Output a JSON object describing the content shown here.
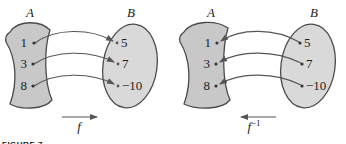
{
  "colors": {
    "set_a_fill": "#c8c8c8",
    "set_b_fill": "#d9d9d9",
    "outline": "#4a4a4a",
    "arrow": "#555555",
    "text": "#222222"
  },
  "left_diagram": {
    "domain_label": "A",
    "codomain_label": "B",
    "domain_points": [
      "1",
      "3",
      "8"
    ],
    "codomain_points": [
      "5",
      "7",
      "−10"
    ],
    "function_label": "f",
    "direction": "A to B"
  },
  "right_diagram": {
    "domain_label": "A",
    "codomain_label": "B",
    "domain_points": [
      "1",
      "3",
      "8"
    ],
    "codomain_points": [
      "5",
      "7",
      "−10"
    ],
    "function_label": "f",
    "function_superscript": "−1",
    "direction": "B to A"
  },
  "caption": "FIGURE 7"
}
